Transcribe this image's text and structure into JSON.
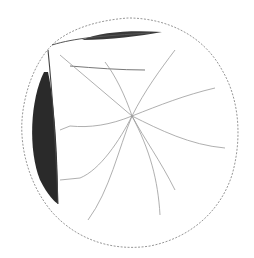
{
  "image": {
    "subject": "botanical line drawing of a round serrated leaf with folded edges",
    "width": 254,
    "height": 258,
    "colors": {
      "background": "#ffffff",
      "outline": "#8a8a8a",
      "veins": "#9a9a9a",
      "shadow": "#2a2a2a",
      "fold_line": "#555555"
    }
  }
}
